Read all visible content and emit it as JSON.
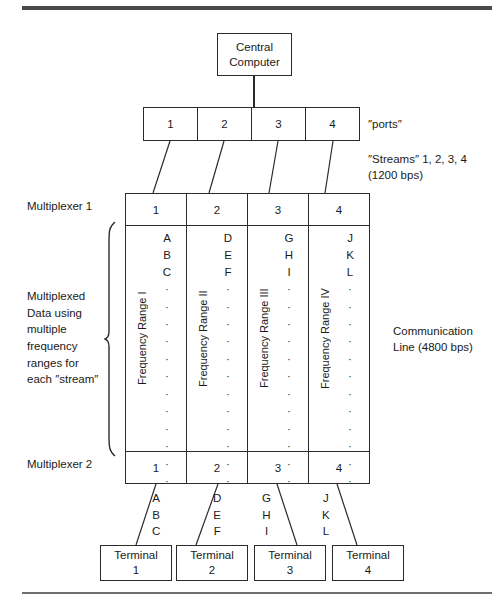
{
  "figure": {
    "central_computer": {
      "line1": "Central",
      "line2": "Computer"
    },
    "ports": {
      "label": "″ports″",
      "cells": [
        "1",
        "2",
        "3",
        "4"
      ]
    },
    "streams": {
      "label": "″Streams″ 1, 2, 3, 4\n(1200 bps)"
    },
    "communication_line": {
      "label": "Communication\nLine (4800 bps)"
    },
    "multiplexer1": {
      "label": "Multiplexer 1",
      "cells": [
        "1",
        "2",
        "3",
        "4"
      ]
    },
    "multiplexer2": {
      "label": "Multiplexer 2",
      "cells": [
        "1",
        "2",
        "3",
        "4"
      ]
    },
    "multiplexed_note": {
      "label": "Multiplexed\nData using\nmultiple\nfrequency\nranges for\neach ″stream″"
    },
    "frequency_columns": [
      {
        "vertical_label": "Frequency Range I",
        "letters": [
          "A",
          "B",
          "C"
        ],
        "dots": 12
      },
      {
        "vertical_label": "Frequency Range II",
        "letters": [
          "D",
          "E",
          "F"
        ],
        "dots": 12
      },
      {
        "vertical_label": "Frequency Range III",
        "letters": [
          "G",
          "H",
          "I"
        ],
        "dots": 12
      },
      {
        "vertical_label": "Frequency Range IV",
        "letters": [
          "J",
          "K",
          "L"
        ],
        "dots": 12
      }
    ],
    "output_letters": [
      {
        "text": "A\nB\nC"
      },
      {
        "text": "D\nE\nF"
      },
      {
        "text": "G\nH\nI"
      },
      {
        "text": "J\nK\nL"
      }
    ],
    "terminals": [
      {
        "line1": "Terminal",
        "line2": "1"
      },
      {
        "line1": "Terminal",
        "line2": "2"
      },
      {
        "line1": "Terminal",
        "line2": "3"
      },
      {
        "line1": "Terminal",
        "line2": "4"
      }
    ],
    "colors": {
      "ink": "#2b2b2b",
      "rule": "#4a4a4a",
      "background": "#ffffff"
    }
  }
}
